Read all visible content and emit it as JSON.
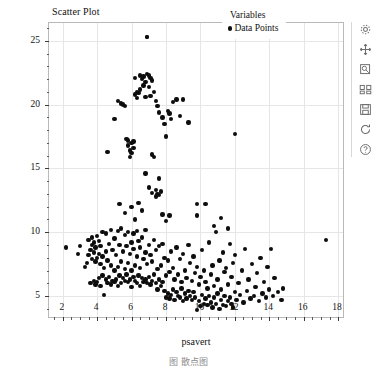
{
  "figure": {
    "title": "Scatter Plot",
    "background_color": "#ffffff",
    "frame_color": "#b9b9b9",
    "grid_color": "#e6e6e6",
    "caption": "图  散点图"
  },
  "legend": {
    "title": "Variables",
    "position": "upper right",
    "entries": [
      {
        "label": "Data Points",
        "marker": "filled-circle",
        "color": "#0d0d0d"
      }
    ]
  },
  "toolbar": {
    "orientation": "vertical",
    "items": [
      {
        "name": "configure-icon",
        "label": "Configure"
      },
      {
        "name": "pan-icon",
        "label": "Pan"
      },
      {
        "name": "zoom-rect-icon",
        "label": "Zoom to rectangle"
      },
      {
        "name": "subplots-icon",
        "label": "Configure subplots"
      },
      {
        "name": "save-icon",
        "label": "Save figure"
      },
      {
        "name": "reset-icon",
        "label": "Reset view"
      },
      {
        "name": "help-icon",
        "label": "Help"
      }
    ]
  },
  "chart_data": {
    "type": "scatter",
    "title": "Scatter Plot",
    "xlabel": "psavert",
    "ylabel": "uempmed",
    "xlim": [
      1.2,
      18.4
    ],
    "ylim": [
      3.2,
      26.4
    ],
    "xticks": [
      2,
      4,
      6,
      8,
      10,
      12,
      14,
      16,
      18
    ],
    "yticks": [
      5,
      10,
      15,
      20,
      25
    ],
    "x_minor_interval": 0.5,
    "y_minor_interval": 1,
    "grid": true,
    "legend_position": "upper right",
    "marker": "filled-circle",
    "marker_color": "#0d0d0d",
    "marker_size": 4.4,
    "series": [
      {
        "name": "Data Points",
        "x": [
          2.2,
          2.9,
          3.0,
          3.3,
          3.4,
          3.5,
          3.5,
          3.6,
          3.6,
          3.7,
          3.7,
          3.7,
          3.8,
          3.8,
          3.8,
          3.9,
          3.9,
          3.9,
          4.0,
          4.0,
          4.0,
          4.1,
          4.1,
          4.1,
          4.2,
          4.2,
          4.2,
          4.3,
          4.3,
          4.3,
          4.4,
          4.4,
          4.5,
          4.5,
          4.5,
          4.6,
          4.6,
          4.7,
          4.7,
          4.8,
          4.8,
          4.8,
          4.9,
          4.9,
          5.0,
          5.0,
          5.0,
          5.1,
          5.1,
          5.2,
          5.2,
          5.2,
          5.3,
          5.3,
          5.4,
          5.4,
          5.4,
          5.5,
          5.5,
          5.6,
          5.6,
          5.6,
          5.7,
          5.7,
          5.8,
          5.8,
          5.8,
          5.9,
          5.9,
          6.0,
          6.0,
          6.0,
          6.1,
          6.1,
          6.1,
          6.2,
          6.2,
          6.3,
          6.3,
          6.3,
          6.4,
          6.4,
          6.5,
          6.5,
          6.5,
          6.6,
          6.6,
          6.7,
          6.7,
          6.8,
          6.8,
          6.8,
          6.9,
          6.9,
          7.0,
          7.0,
          7.1,
          7.1,
          7.2,
          7.2,
          7.3,
          7.3,
          7.4,
          7.4,
          7.5,
          7.5,
          7.6,
          7.6,
          7.7,
          7.7,
          7.8,
          7.8,
          7.9,
          7.9,
          8.0,
          8.0,
          8.1,
          8.1,
          8.2,
          8.2,
          8.3,
          8.3,
          8.4,
          8.4,
          8.5,
          8.5,
          8.6,
          8.6,
          8.7,
          8.7,
          8.8,
          8.8,
          8.9,
          8.9,
          9.0,
          9.0,
          9.1,
          9.1,
          9.2,
          9.2,
          9.3,
          9.3,
          9.4,
          9.4,
          9.5,
          9.5,
          9.6,
          9.6,
          9.7,
          9.7,
          9.8,
          9.8,
          9.9,
          9.9,
          10.0,
          10.0,
          10.1,
          10.1,
          10.2,
          10.2,
          10.3,
          10.3,
          10.4,
          10.4,
          10.5,
          10.5,
          10.6,
          10.6,
          10.7,
          10.7,
          10.8,
          10.8,
          10.9,
          10.9,
          11.0,
          11.0,
          11.1,
          11.1,
          11.2,
          11.2,
          11.3,
          11.3,
          11.4,
          11.4,
          11.5,
          11.5,
          11.6,
          11.6,
          11.7,
          11.7,
          11.8,
          11.8,
          11.9,
          11.9,
          12.0,
          12.0,
          12.1,
          12.2,
          12.3,
          12.4,
          12.5,
          12.6,
          12.7,
          12.8,
          12.9,
          13.0,
          13.1,
          13.2,
          13.3,
          13.4,
          13.5,
          13.6,
          13.7,
          13.8,
          13.9,
          14.0,
          14.1,
          14.2,
          14.3,
          14.5,
          14.7,
          14.8,
          17.3,
          4.6,
          5.0,
          5.2,
          5.4,
          5.5,
          5.6,
          5.7,
          5.8,
          5.8,
          5.9,
          5.9,
          6.0,
          6.0,
          6.1,
          6.1,
          6.2,
          6.2,
          6.3,
          6.3,
          6.4,
          6.5,
          6.5,
          6.6,
          6.7,
          6.7,
          6.8,
          6.8,
          6.9,
          6.9,
          7.0,
          7.0,
          7.1,
          7.1,
          7.2,
          7.2,
          7.3,
          7.3,
          7.4,
          7.4,
          7.5,
          7.5,
          7.6,
          7.6,
          7.7,
          7.8,
          7.9,
          8.0,
          8.1,
          8.2,
          8.3,
          8.4,
          8.6,
          8.8,
          9.0,
          9.3,
          9.8,
          12.0,
          6.9,
          5.3,
          5.6,
          6.0,
          6.2,
          6.4,
          6.6,
          6.8,
          7.0,
          7.2,
          7.4,
          7.6,
          7.8,
          8.0,
          8.2,
          9.8,
          10.3,
          10.8,
          11.2,
          11.6
        ],
        "y": [
          8.8,
          8.3,
          8.9,
          7.3,
          7.6,
          8.2,
          9.4,
          6.0,
          8.6,
          7.9,
          9.0,
          9.6,
          6.2,
          8.4,
          9.2,
          5.9,
          7.7,
          8.8,
          6.1,
          8.0,
          9.7,
          6.4,
          8.3,
          9.3,
          5.8,
          7.5,
          8.9,
          6.6,
          8.1,
          10.0,
          5.1,
          7.2,
          6.3,
          8.5,
          9.9,
          6.0,
          7.8,
          6.5,
          9.1,
          5.9,
          7.4,
          10.2,
          6.2,
          8.6,
          6.1,
          7.0,
          9.5,
          6.3,
          8.2,
          5.8,
          7.3,
          10.1,
          6.6,
          9.0,
          6.0,
          7.7,
          10.3,
          6.4,
          8.5,
          6.2,
          7.1,
          9.8,
          6.7,
          8.9,
          6.1,
          7.6,
          10.0,
          6.3,
          8.3,
          5.7,
          7.0,
          9.2,
          6.5,
          8.7,
          9.9,
          6.2,
          7.4,
          6.0,
          8.1,
          10.1,
          6.6,
          9.3,
          5.8,
          7.2,
          8.8,
          6.4,
          9.6,
          6.1,
          7.9,
          6.3,
          8.4,
          10.2,
          6.0,
          7.5,
          6.5,
          9.0,
          5.9,
          8.2,
          6.2,
          7.7,
          6.7,
          9.4,
          6.0,
          8.6,
          5.5,
          7.1,
          6.3,
          8.9,
          5.8,
          7.4,
          6.1,
          9.1,
          5.4,
          8.0,
          4.9,
          6.6,
          5.2,
          7.8,
          4.8,
          6.9,
          5.1,
          8.5,
          5.5,
          7.2,
          4.7,
          6.3,
          5.3,
          8.8,
          5.0,
          6.7,
          4.9,
          7.9,
          5.6,
          6.1,
          4.6,
          8.3,
          5.2,
          7.0,
          4.8,
          6.4,
          5.4,
          9.0,
          5.0,
          7.6,
          4.7,
          6.2,
          5.3,
          8.1,
          4.9,
          6.8,
          3.9,
          7.3,
          4.6,
          5.9,
          4.2,
          6.5,
          5.1,
          8.6,
          4.4,
          7.0,
          4.8,
          6.1,
          4.3,
          5.6,
          5.0,
          9.2,
          4.5,
          6.7,
          4.1,
          7.4,
          4.9,
          5.8,
          4.4,
          10.0,
          5.2,
          6.3,
          4.0,
          7.8,
          4.7,
          5.5,
          4.3,
          8.4,
          5.0,
          6.9,
          4.2,
          7.2,
          4.6,
          5.9,
          4.9,
          9.1,
          4.4,
          6.5,
          4.1,
          7.6,
          5.3,
          8.2,
          4.7,
          6.0,
          5.1,
          7.0,
          4.5,
          8.7,
          5.4,
          6.3,
          4.8,
          7.5,
          5.0,
          5.7,
          6.8,
          4.6,
          8.0,
          5.2,
          6.1,
          4.9,
          7.3,
          5.5,
          8.7,
          5.0,
          6.4,
          5.3,
          4.7,
          5.6,
          9.4,
          16.3,
          18.9,
          20.3,
          20.1,
          20.0,
          19.9,
          17.3,
          17.2,
          16.8,
          16.4,
          15.9,
          17.0,
          16.2,
          17.1,
          16.6,
          22.1,
          20.8,
          20.5,
          21.0,
          20.9,
          22.3,
          21.2,
          22.0,
          22.2,
          21.5,
          21.8,
          20.6,
          25.3,
          22.4,
          22.3,
          21.4,
          22.1,
          20.7,
          21.9,
          16.1,
          21.0,
          15.9,
          20.3,
          13.3,
          19.9,
          13.0,
          19.4,
          12.9,
          13.2,
          19.0,
          18.5,
          17.5,
          19.5,
          19.3,
          18.9,
          20.2,
          20.4,
          19.1,
          20.4,
          18.6,
          12.2,
          17.7,
          25.3,
          12.2,
          11.5,
          12.0,
          11.0,
          12.3,
          11.7,
          14.6,
          13.5,
          13.1,
          12.8,
          14.2,
          11.4,
          10.9,
          11.3,
          11.3,
          12.2,
          10.5,
          11.1,
          10.3
        ]
      }
    ]
  }
}
